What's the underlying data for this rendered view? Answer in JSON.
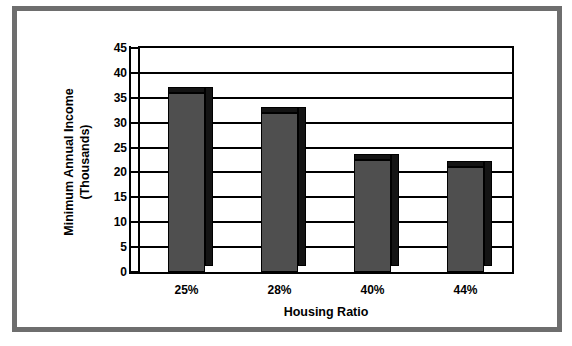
{
  "chart_data": {
    "type": "bar",
    "title": "",
    "categories": [
      "25%",
      "28%",
      "40%",
      "44%"
    ],
    "values": [
      36,
      32,
      22.5,
      21
    ],
    "series": [
      {
        "name": "Minimum Annual Income (Thousands)",
        "values": [
          36,
          32,
          22.5,
          21
        ]
      }
    ],
    "xlabel": "Housing Ratio",
    "ylabel": "Minimum Annual Income (Thousands)",
    "ylabel_line1": "Minimum Annual Income",
    "ylabel_line2": "(Thousands)",
    "ylim": [
      0,
      45
    ],
    "ytick_step": 5,
    "yticks": [
      "45",
      "40",
      "35",
      "30",
      "25",
      "20",
      "15",
      "10",
      "5",
      "0"
    ],
    "ytick_values": [
      45,
      40,
      35,
      30,
      25,
      20,
      15,
      10,
      5,
      0
    ],
    "grid": true,
    "grid_axis": "y",
    "legend": false,
    "legend_position": "none",
    "bar_color": "#4f4f4f",
    "bar_shadow_color": "#141414",
    "axis_color": "#000000",
    "plot_background": "#ffffff",
    "style": "3d-column",
    "frame_color": "#6e6e6e"
  }
}
